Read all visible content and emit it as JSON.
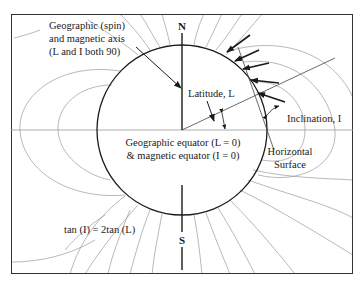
{
  "figure": {
    "poles": {
      "north": "N",
      "south": "S"
    },
    "labels": {
      "axis_line1": "Geographic (spin)",
      "axis_line2": "and magnetic axis",
      "axis_line3": "(L and I both 90)",
      "latitude": "Latitude, L",
      "inclination": "Inclination, I",
      "equator_line1": "Geographic equator (L = 0)",
      "equator_line2": "& magnetic equator (I = 0)",
      "horizontal_line1": "Horizontal",
      "horizontal_line2": "Surface",
      "formula": "tan (I) = 2tan (L)"
    },
    "colors": {
      "earth_outline": "#1a1a1a",
      "field_lines": "#9a9a9a",
      "frame": "#333333",
      "arrows": "#1a1a1a"
    }
  }
}
